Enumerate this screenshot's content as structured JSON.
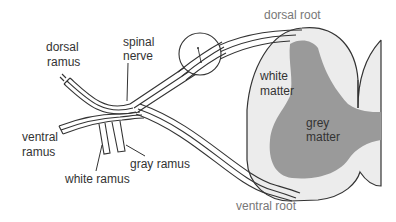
{
  "diagram": {
    "labels": {
      "dorsal_root": "dorsal root",
      "dorsal_ramus_1": "dorsal",
      "dorsal_ramus_2": "ramus",
      "spinal_nerve_1": "spinal",
      "spinal_nerve_2": "nerve",
      "white_matter_1": "white",
      "white_matter_2": "matter",
      "grey_matter_1": "grey",
      "grey_matter_2": "matter",
      "ventral_ramus_1": "ventral",
      "ventral_ramus_2": "ramus",
      "gray_ramus": "gray ramus",
      "white_ramus": "white ramus",
      "ventral_root": "ventral root"
    },
    "colors": {
      "background": "#ffffff",
      "white_matter": "#ececec",
      "grey_matter": "#9a9a9a",
      "outline": "#333333",
      "label": "#333333",
      "root_label": "#777777"
    }
  }
}
